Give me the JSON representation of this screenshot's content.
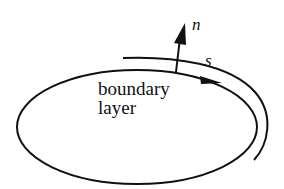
{
  "diagram": {
    "type": "boundary-layer-coordinates",
    "labels": {
      "body_line1": "boundary",
      "body_line2": "layer",
      "normal_axis": "n",
      "tangent_axis": "s"
    },
    "colors": {
      "stroke": "#111111",
      "background": "#ffffff"
    }
  }
}
